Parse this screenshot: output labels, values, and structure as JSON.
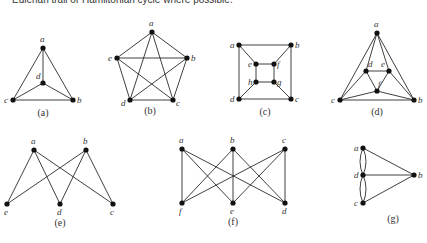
{
  "header": {
    "text": "Eulerian trail or Hamiltonian cycle where possible."
  },
  "graphs": [
    {
      "id": "a",
      "label": "(a)",
      "label_pos": [
        43,
        116
      ],
      "vertices": [
        {
          "name": "a",
          "x": 43,
          "y": 48,
          "lx": 40,
          "ly": 42
        },
        {
          "name": "d",
          "x": 43,
          "y": 83,
          "lx": 36,
          "ly": 79
        },
        {
          "name": "c",
          "x": 13,
          "y": 100,
          "lx": 4,
          "ly": 103
        },
        {
          "name": "b",
          "x": 73,
          "y": 100,
          "lx": 77,
          "ly": 103
        }
      ],
      "edges": [
        [
          "a",
          "d"
        ],
        [
          "a",
          "c"
        ],
        [
          "a",
          "b"
        ],
        [
          "d",
          "c"
        ],
        [
          "d",
          "b"
        ],
        [
          "c",
          "b"
        ]
      ]
    },
    {
      "id": "b",
      "label": "(b)",
      "label_pos": [
        150,
        114
      ],
      "vertices": [
        {
          "name": "a",
          "x": 152,
          "y": 32,
          "lx": 149,
          "ly": 26
        },
        {
          "name": "e",
          "x": 117,
          "y": 58,
          "lx": 108,
          "ly": 61
        },
        {
          "name": "b",
          "x": 187,
          "y": 58,
          "lx": 191,
          "ly": 61
        },
        {
          "name": "d",
          "x": 130,
          "y": 100,
          "lx": 121,
          "ly": 106
        },
        {
          "name": "c",
          "x": 173,
          "y": 100,
          "lx": 176,
          "ly": 106
        }
      ],
      "edges": [
        [
          "a",
          "e"
        ],
        [
          "a",
          "b"
        ],
        [
          "a",
          "d"
        ],
        [
          "a",
          "c"
        ],
        [
          "e",
          "b"
        ],
        [
          "e",
          "d"
        ],
        [
          "e",
          "c"
        ],
        [
          "b",
          "d"
        ],
        [
          "b",
          "c"
        ],
        [
          "d",
          "c"
        ]
      ]
    },
    {
      "id": "c",
      "label": "(c)",
      "label_pos": [
        265,
        115
      ],
      "vertices": [
        {
          "name": "a",
          "x": 239,
          "y": 45,
          "lx": 230,
          "ly": 48
        },
        {
          "name": "b",
          "x": 291,
          "y": 45,
          "lx": 295,
          "ly": 48
        },
        {
          "name": "e",
          "x": 256,
          "y": 64,
          "lx": 248,
          "ly": 67
        },
        {
          "name": "f",
          "x": 274,
          "y": 64,
          "lx": 277,
          "ly": 67
        },
        {
          "name": "h",
          "x": 256,
          "y": 82,
          "lx": 248,
          "ly": 85
        },
        {
          "name": "g",
          "x": 274,
          "y": 82,
          "lx": 277,
          "ly": 85
        },
        {
          "name": "d",
          "x": 239,
          "y": 99,
          "lx": 230,
          "ly": 102
        },
        {
          "name": "c",
          "x": 291,
          "y": 99,
          "lx": 295,
          "ly": 102
        }
      ],
      "edges": [
        [
          "a",
          "b"
        ],
        [
          "a",
          "d"
        ],
        [
          "b",
          "c"
        ],
        [
          "d",
          "c"
        ],
        [
          "e",
          "f"
        ],
        [
          "e",
          "h"
        ],
        [
          "f",
          "g"
        ],
        [
          "h",
          "g"
        ],
        [
          "a",
          "e"
        ],
        [
          "b",
          "f"
        ],
        [
          "d",
          "h"
        ],
        [
          "c",
          "g"
        ]
      ]
    },
    {
      "id": "d",
      "label": "(d)",
      "label_pos": [
        377,
        115
      ],
      "vertices": [
        {
          "name": "a",
          "x": 377,
          "y": 33,
          "lx": 374,
          "ly": 27
        },
        {
          "name": "d",
          "x": 366,
          "y": 71,
          "lx": 368,
          "ly": 67
        },
        {
          "name": "e",
          "x": 389,
          "y": 71,
          "lx": 381,
          "ly": 67
        },
        {
          "name": "f",
          "x": 377,
          "y": 91,
          "lx": 378,
          "ly": 87
        },
        {
          "name": "c",
          "x": 340,
          "y": 100,
          "lx": 331,
          "ly": 103
        },
        {
          "name": "b",
          "x": 414,
          "y": 100,
          "lx": 418,
          "ly": 103
        }
      ],
      "edges": [
        [
          "a",
          "c"
        ],
        [
          "a",
          "b"
        ],
        [
          "a",
          "d"
        ],
        [
          "a",
          "e"
        ],
        [
          "d",
          "e"
        ],
        [
          "d",
          "f"
        ],
        [
          "e",
          "f"
        ],
        [
          "d",
          "c"
        ],
        [
          "e",
          "b"
        ],
        [
          "c",
          "f"
        ],
        [
          "f",
          "b"
        ],
        [
          "c",
          "b"
        ]
      ]
    },
    {
      "id": "e",
      "label": "(e)",
      "label_pos": [
        60,
        226
      ],
      "vertices": [
        {
          "name": "a",
          "x": 34,
          "y": 150,
          "lx": 31,
          "ly": 144
        },
        {
          "name": "b",
          "x": 86,
          "y": 150,
          "lx": 83,
          "ly": 144
        },
        {
          "name": "e",
          "x": 7,
          "y": 204,
          "lx": 4,
          "ly": 215
        },
        {
          "name": "d",
          "x": 60,
          "y": 204,
          "lx": 57,
          "ly": 215
        },
        {
          "name": "c",
          "x": 113,
          "y": 204,
          "lx": 110,
          "ly": 215
        }
      ],
      "edges": [
        [
          "a",
          "e"
        ],
        [
          "a",
          "d"
        ],
        [
          "a",
          "c"
        ],
        [
          "b",
          "e"
        ],
        [
          "b",
          "d"
        ],
        [
          "b",
          "c"
        ]
      ]
    },
    {
      "id": "f",
      "label": "(f)",
      "label_pos": [
        233,
        225
      ],
      "vertices": [
        {
          "name": "a",
          "x": 182,
          "y": 149,
          "lx": 179,
          "ly": 143
        },
        {
          "name": "b",
          "x": 233,
          "y": 149,
          "lx": 230,
          "ly": 143
        },
        {
          "name": "c",
          "x": 285,
          "y": 149,
          "lx": 282,
          "ly": 143
        },
        {
          "name": "f",
          "x": 182,
          "y": 203,
          "lx": 179,
          "ly": 214
        },
        {
          "name": "e",
          "x": 233,
          "y": 203,
          "lx": 230,
          "ly": 214
        },
        {
          "name": "d",
          "x": 285,
          "y": 203,
          "lx": 282,
          "ly": 214
        }
      ],
      "edges": [
        [
          "a",
          "f"
        ],
        [
          "a",
          "e"
        ],
        [
          "a",
          "d"
        ],
        [
          "b",
          "f"
        ],
        [
          "b",
          "e"
        ],
        [
          "b",
          "d"
        ],
        [
          "c",
          "f"
        ],
        [
          "c",
          "e"
        ],
        [
          "c",
          "d"
        ]
      ]
    },
    {
      "id": "g",
      "label": "(g)",
      "label_pos": [
        393,
        222
      ],
      "vertices": [
        {
          "name": "a",
          "x": 363,
          "y": 148,
          "lx": 354,
          "ly": 151
        },
        {
          "name": "d",
          "x": 363,
          "y": 175,
          "lx": 354,
          "ly": 178
        },
        {
          "name": "c",
          "x": 363,
          "y": 203,
          "lx": 354,
          "ly": 206
        },
        {
          "name": "b",
          "x": 414,
          "y": 175,
          "lx": 418,
          "ly": 178
        }
      ],
      "edges": [
        [
          "a",
          "b"
        ],
        [
          "d",
          "b"
        ],
        [
          "c",
          "b"
        ]
      ],
      "multi_edges": [
        {
          "from": "a",
          "to": "d",
          "count": 2
        },
        {
          "from": "d",
          "to": "c",
          "count": 2
        }
      ]
    }
  ]
}
